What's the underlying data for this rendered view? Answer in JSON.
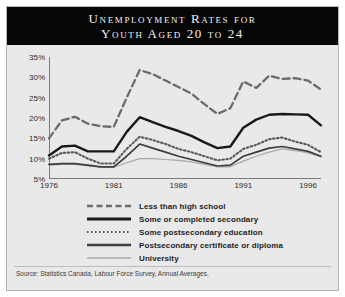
{
  "title": {
    "line1": "Unemployment Rates for",
    "line2": "Youth Aged 20 to 24"
  },
  "source": "Source: Statistics Canada, Labour Force Survey, Annual Averages.",
  "legend": [
    {
      "label": "Less than high school",
      "style": "dashed",
      "color": "#6b6b6b"
    },
    {
      "label": "Some or completed secondary",
      "style": "solid-thick",
      "color": "#1a1a1a"
    },
    {
      "label": "Some postsecondary education",
      "style": "dotted",
      "color": "#5a5a5a"
    },
    {
      "label": "Postsecondary certificate or diploma",
      "style": "solid-medium",
      "color": "#3d3d3d"
    },
    {
      "label": "University",
      "style": "solid-thin",
      "color": "#a8a8a8"
    }
  ],
  "chart_data": {
    "type": "line",
    "title": "Unemployment Rates for Youth Aged 20 to 24",
    "xlabel": "",
    "ylabel": "",
    "ylim": [
      5,
      35
    ],
    "yticks": [
      "5%",
      "10%",
      "15%",
      "20%",
      "25%",
      "30%",
      "35%"
    ],
    "ytick_values": [
      5,
      10,
      15,
      20,
      25,
      30,
      35
    ],
    "xticks": [
      "1976",
      "1981",
      "1986",
      "1991",
      "1996"
    ],
    "xtick_values": [
      1976,
      1981,
      1986,
      1991,
      1996
    ],
    "xlim": [
      1976,
      1997
    ],
    "grid": false,
    "legend_position": "below",
    "x": [
      1976,
      1977,
      1978,
      1979,
      1980,
      1981,
      1982,
      1983,
      1984,
      1985,
      1986,
      1987,
      1988,
      1989,
      1990,
      1991,
      1992,
      1993,
      1994,
      1995,
      1996,
      1997
    ],
    "series": [
      {
        "name": "Less than high school",
        "values": [
          15.0,
          19.4,
          20.3,
          18.6,
          18.0,
          17.8,
          25.0,
          31.8,
          30.8,
          29.2,
          27.6,
          26.0,
          23.4,
          21.0,
          22.4,
          29.0,
          27.4,
          30.4,
          29.6,
          29.8,
          29.2,
          27.0
        ]
      },
      {
        "name": "Some or completed secondary",
        "values": [
          10.8,
          13.0,
          13.2,
          11.8,
          11.8,
          11.8,
          16.6,
          20.2,
          19.0,
          17.8,
          16.8,
          15.6,
          14.0,
          12.6,
          13.0,
          17.6,
          19.6,
          20.8,
          21.0,
          20.9,
          20.8,
          18.2
        ]
      },
      {
        "name": "Some postsecondary education",
        "values": [
          10.0,
          11.4,
          11.6,
          10.0,
          8.8,
          8.8,
          12.4,
          15.4,
          14.6,
          13.6,
          12.4,
          11.6,
          10.6,
          9.6,
          10.0,
          12.4,
          13.4,
          14.8,
          15.2,
          14.2,
          13.4,
          11.6
        ]
      },
      {
        "name": "Postsecondary certificate or diploma",
        "values": [
          8.6,
          8.8,
          8.8,
          8.4,
          8.0,
          8.0,
          10.6,
          13.6,
          12.6,
          11.6,
          10.6,
          9.8,
          9.0,
          8.2,
          8.4,
          10.6,
          11.6,
          12.6,
          13.0,
          12.4,
          11.8,
          10.6
        ]
      },
      {
        "name": "University",
        "values": [
          8.4,
          8.6,
          8.6,
          8.2,
          7.9,
          7.9,
          9.0,
          10.0,
          10.0,
          9.8,
          9.6,
          9.2,
          8.6,
          8.0,
          8.0,
          9.4,
          10.6,
          11.6,
          12.4,
          12.0,
          11.4,
          10.4
        ]
      }
    ]
  }
}
